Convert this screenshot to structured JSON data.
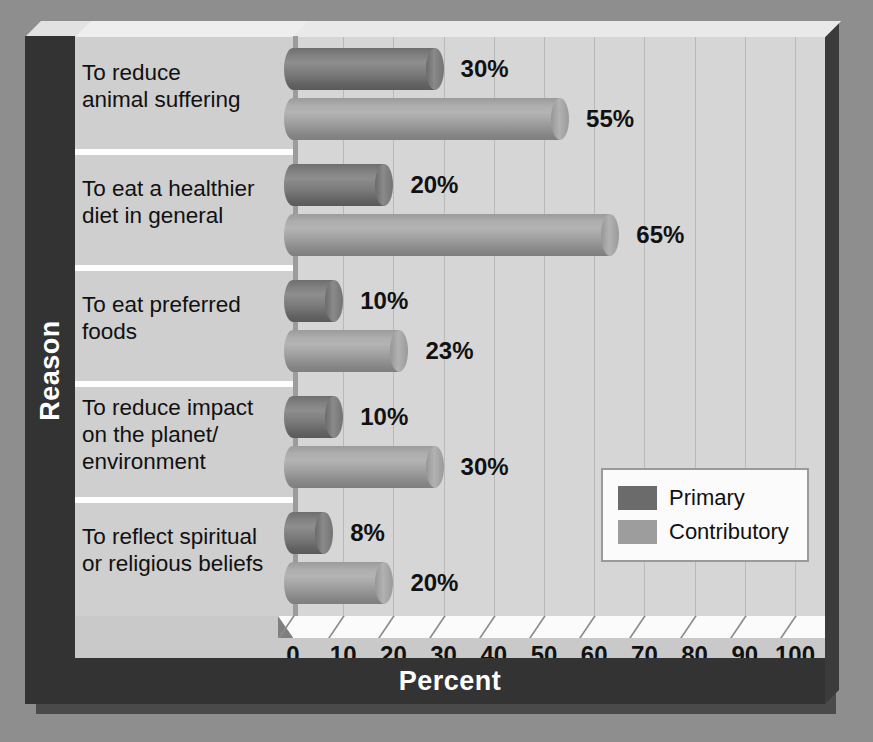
{
  "chart_data": {
    "type": "bar",
    "orientation": "horizontal",
    "title": "",
    "xlabel": "Percent",
    "ylabel": "Reason",
    "xlim": [
      0,
      100
    ],
    "xticks": [
      0,
      10,
      20,
      30,
      40,
      50,
      60,
      70,
      80,
      90,
      100
    ],
    "xtick_labels": [
      "0",
      "10",
      "20",
      "30",
      "40",
      "50",
      "60",
      "70",
      "80",
      "90",
      "100"
    ],
    "grid": true,
    "legend_position": "middle-right",
    "categories": [
      "To reduce animal suffering",
      "To eat a healthier diet in general",
      "To eat preferred foods",
      "To reduce impact on the planet/environment",
      "To reflect spiritual or religious beliefs"
    ],
    "category_lines": [
      [
        "To reduce",
        "animal suffering"
      ],
      [
        "To eat a healthier",
        "diet in general"
      ],
      [
        "To eat preferred",
        "foods"
      ],
      [
        "To reduce impact",
        "on the planet/",
        "environment"
      ],
      [
        "To reflect spiritual",
        "or religious beliefs"
      ]
    ],
    "series": [
      {
        "name": "Primary",
        "color": "#6b6b6b",
        "values": [
          30,
          20,
          10,
          10,
          8
        ],
        "labels": [
          "30%",
          "20%",
          "10%",
          "10%",
          "8%"
        ]
      },
      {
        "name": "Contributory",
        "color": "#9d9d9d",
        "values": [
          55,
          65,
          23,
          30,
          20
        ],
        "labels": [
          "55%",
          "65%",
          "23%",
          "30%",
          "20%"
        ]
      }
    ]
  },
  "legend": {
    "entries": [
      {
        "label": "Primary",
        "swatch": "primary"
      },
      {
        "label": "Contributory",
        "swatch": "contrib"
      }
    ]
  },
  "axes": {
    "x_title": "Percent",
    "y_title": "Reason"
  }
}
